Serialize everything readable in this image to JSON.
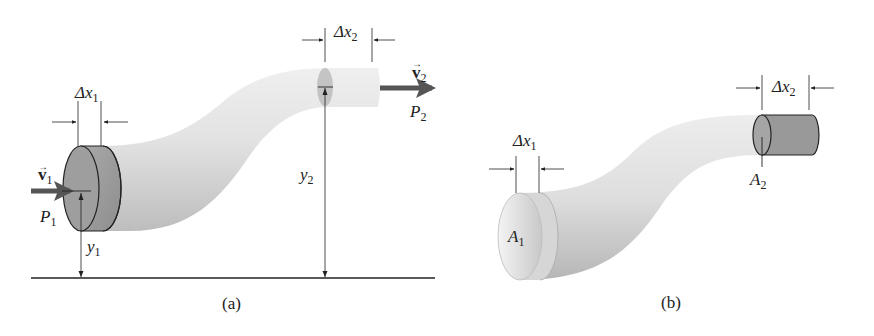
{
  "figure": {
    "panels": [
      {
        "id": "a",
        "caption": "(a)",
        "labels": {
          "dx1": {
            "symbol": "Δx",
            "sub": "1"
          },
          "dx2": {
            "symbol": "Δx",
            "sub": "2"
          },
          "v1": {
            "symbol": "v",
            "sub": "1",
            "vector": "→"
          },
          "v2": {
            "symbol": "v",
            "sub": "2",
            "vector": "→"
          },
          "p1": {
            "symbol": "P",
            "sub": "1"
          },
          "p2": {
            "symbol": "P",
            "sub": "2"
          },
          "y1": {
            "symbol": "y",
            "sub": "1"
          },
          "y2": {
            "symbol": "y",
            "sub": "2"
          }
        }
      },
      {
        "id": "b",
        "caption": "(b)",
        "labels": {
          "dx1": {
            "symbol": "Δx",
            "sub": "1"
          },
          "dx2": {
            "symbol": "Δx",
            "sub": "2"
          },
          "a1": {
            "symbol": "A",
            "sub": "1"
          },
          "a2": {
            "symbol": "A",
            "sub": "2"
          }
        }
      }
    ],
    "colors": {
      "pipe_light": "#e6e6e6",
      "pipe_mid": "#cfcfcf",
      "pipe_dark": "#a8a8a8",
      "fluid_slab": "#9a9a9a",
      "arrow": "#555555",
      "line": "#222222"
    }
  }
}
